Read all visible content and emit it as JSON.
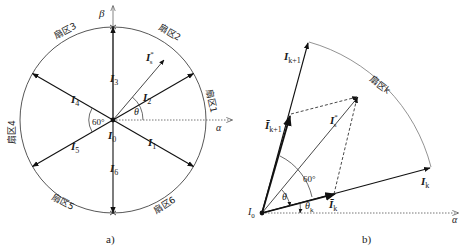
{
  "figure_a": {
    "caption": "a)",
    "axis_alpha": "α",
    "axis_beta": "β",
    "sectors": [
      "扇区1",
      "扇区2",
      "扇区3",
      "扇区4",
      "扇区5",
      "扇区6"
    ],
    "vectors": {
      "I0": "I",
      "I0_sub": "0",
      "I1": "I",
      "I1_sub": "1",
      "I2": "I",
      "I2_sub": "2",
      "I3": "I",
      "I3_sub": "3",
      "I4": "I",
      "I4_sub": "4",
      "I5": "I",
      "I5_sub": "5",
      "I6": "I",
      "I6_sub": "6",
      "Is": "I",
      "Is_sup": "*",
      "Is_sub": "s"
    },
    "angle_60": "60°",
    "angle_theta": "θ"
  },
  "figure_b": {
    "caption": "b)",
    "axis_alpha": "α",
    "sector": "扇区k",
    "origin": "I",
    "origin_sub": "0",
    "Ik": "I",
    "Ik_sub": "k",
    "Ik1": "I",
    "Ik1_sub": "k+1",
    "Ik_bar": "Ī",
    "Ik_bar_sub": "k",
    "Ik1_bar": "Ī",
    "Ik1_bar_sub": "k+1",
    "Is": "I",
    "Is_sup": "*",
    "Is_sub": "s",
    "angle_60": "60°",
    "angle_theta": "θ",
    "angle_theta_k": "θ",
    "angle_theta_k_sub": "k"
  }
}
